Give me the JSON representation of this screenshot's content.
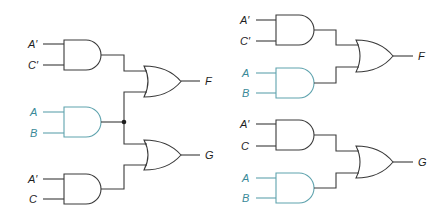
{
  "colors": {
    "black": "#3a3a3a",
    "teal": "#5fa3ae",
    "teal_text": "#3a8a99"
  },
  "left_circuit": {
    "inputs": [
      {
        "label": "A′",
        "color": "black"
      },
      {
        "label": "C′",
        "color": "black"
      },
      {
        "label": "A",
        "color": "teal"
      },
      {
        "label": "B",
        "color": "teal"
      },
      {
        "label": "A′",
        "color": "black"
      },
      {
        "label": "C",
        "color": "black"
      }
    ],
    "outputs": [
      {
        "label": "F"
      },
      {
        "label": "G"
      }
    ],
    "gates": [
      {
        "type": "AND",
        "inputs": [
          "A′",
          "C′"
        ],
        "color": "black"
      },
      {
        "type": "AND",
        "inputs": [
          "A",
          "B"
        ],
        "color": "teal",
        "shared": true
      },
      {
        "type": "AND",
        "inputs": [
          "A′",
          "C"
        ],
        "color": "black"
      },
      {
        "type": "OR",
        "output": "F"
      },
      {
        "type": "OR",
        "output": "G"
      }
    ]
  },
  "right_circuit": {
    "inputs": [
      {
        "label": "A′",
        "color": "black"
      },
      {
        "label": "C′",
        "color": "black"
      },
      {
        "label": "A",
        "color": "teal"
      },
      {
        "label": "B",
        "color": "teal"
      },
      {
        "label": "A′",
        "color": "black"
      },
      {
        "label": "C",
        "color": "black"
      },
      {
        "label": "A",
        "color": "teal"
      },
      {
        "label": "B",
        "color": "teal"
      }
    ],
    "outputs": [
      {
        "label": "F"
      },
      {
        "label": "G"
      }
    ],
    "gates": [
      {
        "type": "AND",
        "inputs": [
          "A′",
          "C′"
        ],
        "color": "black"
      },
      {
        "type": "AND",
        "inputs": [
          "A",
          "B"
        ],
        "color": "teal"
      },
      {
        "type": "OR",
        "output": "F"
      },
      {
        "type": "AND",
        "inputs": [
          "A′",
          "C"
        ],
        "color": "black"
      },
      {
        "type": "AND",
        "inputs": [
          "A",
          "B"
        ],
        "color": "teal"
      },
      {
        "type": "OR",
        "output": "G"
      }
    ]
  }
}
